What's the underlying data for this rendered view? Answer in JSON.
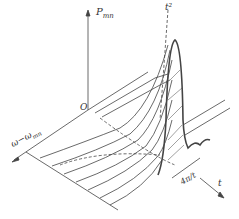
{
  "labels": {
    "y_axis": "P",
    "y_axis_sub": "mn",
    "origin": "O",
    "freq_axis": "ω−ω",
    "freq_axis_sub": "mn",
    "peak_curve": "t²",
    "width": "4π/t",
    "time_axis": "t"
  },
  "colors": {
    "ink": "#333333",
    "background": "#ffffff"
  }
}
